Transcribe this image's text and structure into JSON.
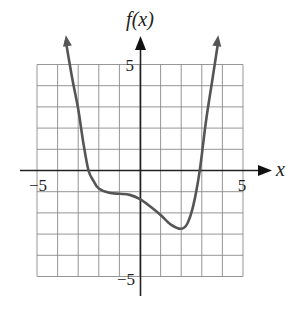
{
  "chart_data": {
    "type": "line",
    "title": "",
    "xlabel": "x",
    "ylabel": "f(x)",
    "xlim": [
      -5,
      5
    ],
    "ylim": [
      -5,
      5
    ],
    "grid": true,
    "grid_step": 1,
    "x_tick_labels": [
      {
        "value": -5,
        "label": "−5"
      },
      {
        "value": 5,
        "label": "5"
      }
    ],
    "y_tick_labels": [
      {
        "value": 5,
        "label": "5"
      },
      {
        "value": -5,
        "label": "−5"
      }
    ],
    "curve_ends_with_arrows": true,
    "series": [
      {
        "name": "f(x)",
        "color": "#555555",
        "points": [
          [
            -3.6,
            6.1
          ],
          [
            -3.3,
            4.4
          ],
          [
            -3.0,
            2.9
          ],
          [
            -2.75,
            1.3
          ],
          [
            -2.5,
            0.0
          ],
          [
            -2.25,
            -0.5
          ],
          [
            -2.0,
            -0.85
          ],
          [
            -1.5,
            -1.05
          ],
          [
            -1.0,
            -1.1
          ],
          [
            -0.5,
            -1.15
          ],
          [
            0.0,
            -1.35
          ],
          [
            0.5,
            -1.7
          ],
          [
            1.0,
            -2.1
          ],
          [
            1.5,
            -2.55
          ],
          [
            2.0,
            -2.75
          ],
          [
            2.3,
            -2.5
          ],
          [
            2.6,
            -1.6
          ],
          [
            2.9,
            0.0
          ],
          [
            3.2,
            2.3
          ],
          [
            3.5,
            4.2
          ],
          [
            3.8,
            6.1
          ]
        ]
      }
    ],
    "features": {
      "x_intercepts": [
        -2.5,
        2.9
      ],
      "y_intercept": -1.35,
      "local_minimum": [
        2.0,
        -2.75
      ]
    }
  },
  "labels": {
    "y_axis": "f(x)",
    "x_axis": "x",
    "x_min": "−5",
    "x_max": "5",
    "y_max": "5",
    "y_min": "−5"
  }
}
